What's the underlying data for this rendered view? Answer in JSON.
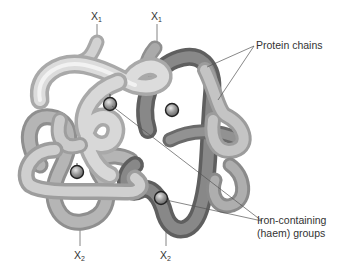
{
  "diagram": {
    "subunit_labels": [
      {
        "base": "X",
        "sub": "1",
        "x": 91,
        "y": 10
      },
      {
        "base": "X",
        "sub": "1",
        "x": 151,
        "y": 10
      },
      {
        "base": "X",
        "sub": "2",
        "x": 74,
        "y": 250
      },
      {
        "base": "X",
        "sub": "2",
        "x": 160,
        "y": 250
      }
    ],
    "callouts": {
      "protein_chains": "Protein chains",
      "iron_line1": "Iron-containing",
      "iron_line2": "(haem) groups"
    },
    "colors": {
      "light_chain": "#c9c9c9",
      "light_chain_highlight": "#eeeeee",
      "mid_chain": "#a8a8a8",
      "dark_chain": "#7d7d7d",
      "dark_chain_highlight": "#9a9a9a",
      "haem_group": "#8a8a8a",
      "leader_line": "#555555",
      "text": "#333333"
    }
  }
}
